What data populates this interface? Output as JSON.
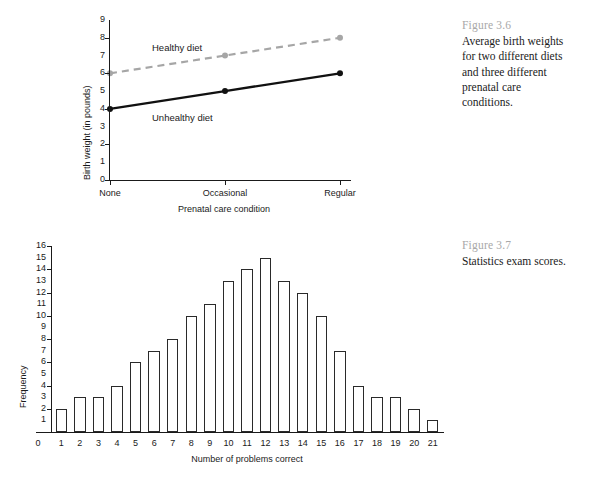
{
  "figures": [
    {
      "id": "fig36",
      "number": "Figure 3.6",
      "caption": "Average birth weights for two different diets and three different prenatal care conditions."
    },
    {
      "id": "fig37",
      "number": "Figure 3.7",
      "caption": "Statistics exam scores."
    }
  ],
  "chart_data": [
    {
      "type": "line",
      "title": "",
      "xlabel": "Prenatal care condition",
      "ylabel": "Birth weight (in pounds)",
      "categories": [
        "None",
        "Occasional",
        "Regular"
      ],
      "ylim": [
        0,
        9
      ],
      "yticks": [
        0,
        1,
        2,
        3,
        4,
        5,
        6,
        7,
        8,
        9
      ],
      "ytick_marks": [
        0,
        2,
        4,
        6,
        8
      ],
      "grid": false,
      "legend": "inline-labels",
      "series": [
        {
          "name": "Healthy diet",
          "values": [
            6,
            7,
            8
          ],
          "color": "#a6a6a6",
          "style": "dashed",
          "marker": "circle"
        },
        {
          "name": "Unhealthy diet",
          "values": [
            4,
            5,
            6
          ],
          "color": "#111111",
          "style": "solid",
          "marker": "circle"
        }
      ]
    },
    {
      "type": "bar",
      "title": "",
      "xlabel": "Number of problems correct",
      "ylabel": "Frequency",
      "categories": [
        1,
        2,
        3,
        4,
        5,
        6,
        7,
        8,
        9,
        10,
        11,
        12,
        13,
        14,
        15,
        16,
        17,
        18,
        19,
        20,
        21
      ],
      "values": [
        2,
        3,
        3,
        4,
        6,
        7,
        8,
        10,
        11,
        13,
        14,
        15,
        13,
        12,
        10,
        7,
        4,
        3,
        3,
        2,
        1
      ],
      "ylim": [
        0,
        16
      ],
      "yticks": [
        0,
        1,
        2,
        3,
        4,
        5,
        6,
        7,
        8,
        9,
        10,
        11,
        12,
        13,
        14,
        15,
        16
      ],
      "ytick_marks": [
        2,
        4,
        6,
        8,
        10,
        12,
        14,
        16
      ],
      "xtick_zero_label": "0",
      "grid": false,
      "bar_color": "#ffffff",
      "bar_edge_color": "#2a2a2a"
    }
  ]
}
